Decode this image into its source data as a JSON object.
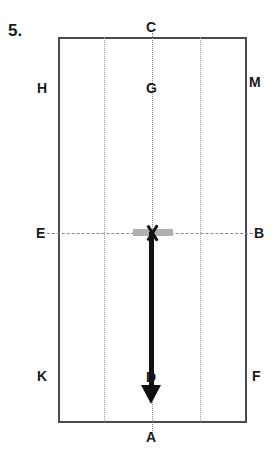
{
  "question": {
    "number_label": "5."
  },
  "diagram": {
    "type": "volleyball-court-movement-diagram",
    "shape": "rectangle",
    "points": [
      {
        "id": "C",
        "label": "C",
        "position": "top-center-outside"
      },
      {
        "id": "H",
        "label": "H",
        "position": "upper-left-outside"
      },
      {
        "id": "G",
        "label": "G",
        "position": "upper-center-inside"
      },
      {
        "id": "M",
        "label": "M",
        "position": "upper-right-outside"
      },
      {
        "id": "E",
        "label": "E",
        "position": "middle-left-outside"
      },
      {
        "id": "B",
        "label": "B",
        "position": "middle-right-outside"
      },
      {
        "id": "K",
        "label": "K",
        "position": "lower-left-outside"
      },
      {
        "id": "F",
        "label": "F",
        "position": "lower-right-outside"
      },
      {
        "id": "A",
        "label": "A",
        "position": "bottom-center-outside"
      },
      {
        "id": "D",
        "label": "D",
        "position": "lower-center-on-arrow"
      }
    ],
    "marker": {
      "glyph": "X",
      "name": "x-marker",
      "location": "center of E-B dashed line"
    },
    "arrow": {
      "name": "downward-movement-arrow",
      "direction": "down",
      "from": "X",
      "to": "A"
    },
    "bar": {
      "name": "grey-bar",
      "color": "#b0b0b0"
    },
    "colors": {
      "rect_border": "#4a4a52",
      "dotted_line": "#9a9a9a",
      "dashed_line": "#8a8a8a",
      "arrow": "#111111",
      "text": "#1a1a1a",
      "background": "#ffffff"
    }
  }
}
